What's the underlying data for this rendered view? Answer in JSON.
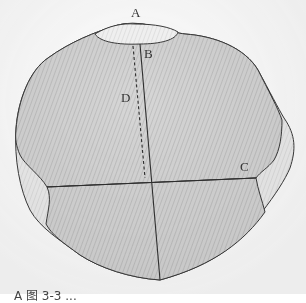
{
  "figure": {
    "type": "diagram",
    "labels": {
      "A": "A",
      "B": "B",
      "C": "C",
      "D": "D"
    },
    "caption": "A 图 3-3 ..."
  },
  "colors": {
    "outline": "#3a3a3a",
    "fill_main": "#cfcfcf",
    "fill_light": "#ececec",
    "hatch": "#bdbdbd"
  }
}
